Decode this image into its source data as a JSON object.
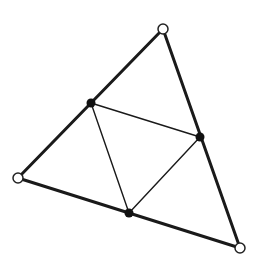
{
  "diagram": {
    "title": "",
    "colors": {
      "background": "#ffffff",
      "outer_edge": "#1a1a1a",
      "inner_edge": "#1a1a1a",
      "midpoint_fill": "#111111",
      "vertex_fill": "#ffffff",
      "vertex_stroke": "#222222"
    },
    "vertices": [
      {
        "id": "A",
        "x": 163,
        "y": 29,
        "style": "open-circle"
      },
      {
        "id": "B",
        "x": 18,
        "y": 178,
        "style": "open-circle"
      },
      {
        "id": "C",
        "x": 240,
        "y": 248,
        "style": "open-circle"
      }
    ],
    "midpoints": [
      {
        "id": "M_AB",
        "x": 91,
        "y": 103,
        "style": "filled-circle"
      },
      {
        "id": "M_AC",
        "x": 200,
        "y": 137,
        "style": "filled-circle"
      },
      {
        "id": "M_BC",
        "x": 129,
        "y": 213,
        "style": "filled-circle"
      }
    ],
    "outer_edges": [
      {
        "from": "A",
        "to": "B"
      },
      {
        "from": "B",
        "to": "C"
      },
      {
        "from": "C",
        "to": "A"
      }
    ],
    "inner_edges": [
      {
        "from": "M_AB",
        "to": "M_AC"
      },
      {
        "from": "M_AC",
        "to": "M_BC"
      },
      {
        "from": "M_BC",
        "to": "M_AB"
      }
    ]
  }
}
